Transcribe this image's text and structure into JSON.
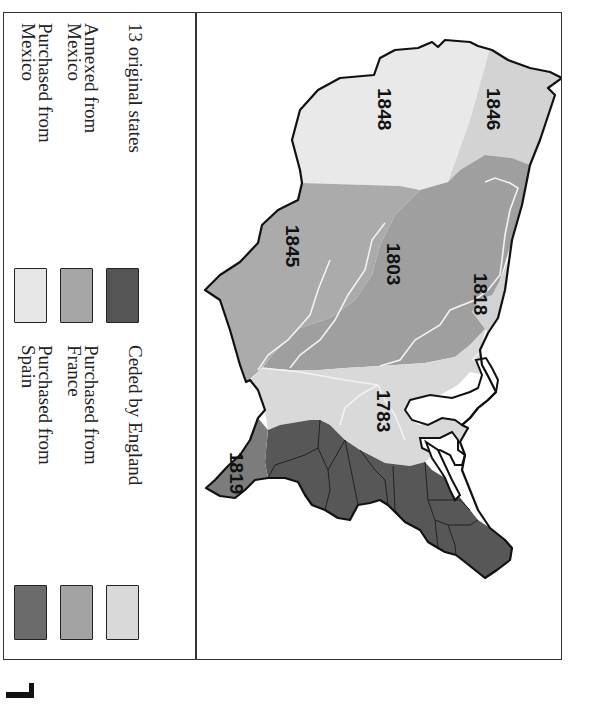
{
  "legend": {
    "columns": [
      {
        "items": [
          {
            "label": "13 original states",
            "color": "#555555"
          },
          {
            "label_lines": [
              "Annexed from",
              "Mexico"
            ],
            "color": "#a6a6a6"
          },
          {
            "label_lines": [
              "Purchased from",
              "Mexico"
            ],
            "color": "#e6e6e6"
          }
        ]
      },
      {
        "items": [
          {
            "label": "Ceded by England",
            "color": "#d9d9d9"
          },
          {
            "label_lines": [
              "Purchased from",
              "France"
            ],
            "color": "#a3a3a3"
          },
          {
            "label_lines": [
              "Purchased from",
              "Spain"
            ],
            "color": "#6b6b6b"
          }
        ]
      }
    ]
  },
  "map": {
    "orientation": "rotated 90 degrees clockwise",
    "regions": [
      {
        "year": "1848",
        "name": "Mexican Cession",
        "color": "#e8e8e8"
      },
      {
        "year": "1846",
        "name": "Oregon Country",
        "color": "#d4d4d4"
      },
      {
        "year": "1845",
        "name": "Texas Annexation",
        "color": "#a8a8a8"
      },
      {
        "year": "1803",
        "name": "Louisiana Purchase",
        "color": "#9c9c9c"
      },
      {
        "year": "1818",
        "name": "Red River Cession",
        "color": "#d2d2d2"
      },
      {
        "year": "1783",
        "name": "Treaty of Paris",
        "color": "#d8d8d8"
      },
      {
        "year": "1819",
        "name": "Florida Purchase",
        "color": "#7a7a7a"
      }
    ],
    "original_states_color": "#555555",
    "outline_color": "#111111",
    "river_color": "#eeeeee"
  }
}
